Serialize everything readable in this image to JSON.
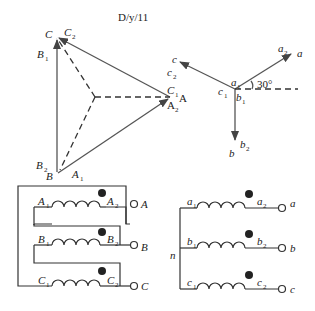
{
  "title": "D/y/11",
  "delta_phasor": {
    "vertices": {
      "C": {
        "label": "C",
        "windings": [
          "C2",
          "B1"
        ]
      },
      "A": {
        "label": "A",
        "windings": [
          "C1",
          "A2"
        ]
      },
      "B": {
        "label": "B",
        "windings": [
          "B2",
          "A1"
        ]
      }
    },
    "labels": {
      "C": "C",
      "C2": "C",
      "C2_sub": "2",
      "B1": "B",
      "B1_sub": "1",
      "A": "A",
      "C1": "C",
      "C1_sub": "1",
      "A2": "A",
      "A2_sub": "2",
      "B": "B",
      "B2": "B",
      "B2_sub": "2",
      "A1": "A",
      "A1_sub": "1"
    }
  },
  "wye_phasor": {
    "labels": {
      "a": "a",
      "a2": "a",
      "a2_sub": "2",
      "c": "c",
      "c2": "c",
      "c2_sub": "2",
      "b": "b",
      "b2": "b",
      "b2_sub": "2",
      "a1": "a",
      "a1_sub": "1",
      "c1": "c",
      "c1_sub": "1",
      "b1": "b",
      "b1_sub": "1"
    },
    "angle": "30°"
  },
  "delta_winding": {
    "phases": [
      {
        "start": "A",
        "start_sub": "1",
        "end": "A",
        "end_sub": "2",
        "terminal": "A"
      },
      {
        "start": "B",
        "start_sub": "1",
        "end": "B",
        "end_sub": "2",
        "terminal": "B"
      },
      {
        "start": "C",
        "start_sub": "1",
        "end": "C",
        "end_sub": "2",
        "terminal": "C"
      }
    ]
  },
  "wye_winding": {
    "neutral": "n",
    "phases": [
      {
        "start": "a",
        "start_sub": "1",
        "end": "a",
        "end_sub": "2",
        "terminal": "a"
      },
      {
        "start": "b",
        "start_sub": "1",
        "end": "b",
        "end_sub": "2",
        "terminal": "b"
      },
      {
        "start": "c",
        "start_sub": "1",
        "end": "c",
        "end_sub": "2",
        "terminal": "c"
      }
    ]
  }
}
